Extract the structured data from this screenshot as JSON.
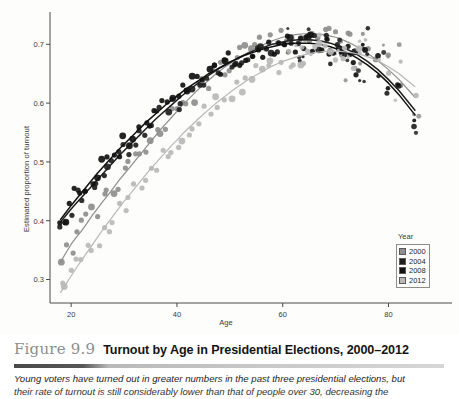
{
  "figure": {
    "number": "Figure 9.9",
    "title": "Turnout by Age in Presidential Elections, 2000–2012",
    "caption_line_1": "Young voters have turned out in greater numbers in the past three presidential elections, but",
    "caption_line_2": "their rate of turnout is still considerably lower than that of people over 30, decreasing the"
  },
  "legend": {
    "title": "Year",
    "items": [
      {
        "label": "2000",
        "color": "#8e8e8e"
      },
      {
        "label": "2004",
        "color": "#1f1f1f"
      },
      {
        "label": "2008",
        "color": "#111111"
      },
      {
        "label": "2012",
        "color": "#b8b8b8"
      }
    ]
  },
  "chart_data": {
    "type": "scatter",
    "title": "Turnout by Age in Presidential Elections, 2000–2012",
    "xlabel": "Age",
    "ylabel": "Estimated proportion of turnout",
    "xlim": [
      16,
      92
    ],
    "ylim": [
      0.26,
      0.755
    ],
    "xticks": [
      20,
      40,
      60,
      80
    ],
    "yticks": [
      0.3,
      0.4,
      0.5,
      0.6,
      0.7
    ],
    "ytick_labels": [
      "0.3",
      "0.4",
      "0.5",
      "0.6",
      "0.7"
    ],
    "xtick_labels": [
      "20",
      "40",
      "60",
      "80"
    ],
    "grid": false,
    "legend_position": "bottom-right",
    "legend_title": "Year",
    "series": [
      {
        "name": "2000",
        "color": "#8e8e8e",
        "x": [
          18,
          19,
          20,
          21,
          22,
          23,
          24,
          25,
          26,
          27,
          28,
          29,
          30,
          31,
          32,
          33,
          34,
          35,
          36,
          37,
          38,
          39,
          40,
          41,
          42,
          43,
          44,
          45,
          46,
          47,
          48,
          49,
          50,
          51,
          52,
          53,
          54,
          55,
          56,
          57,
          58,
          59,
          60,
          61,
          62,
          63,
          64,
          65,
          66,
          67,
          68,
          69,
          70,
          71,
          72,
          73,
          74,
          75,
          76,
          78,
          80,
          82,
          85
        ],
        "y": [
          0.33,
          0.345,
          0.36,
          0.372,
          0.383,
          0.396,
          0.409,
          0.421,
          0.433,
          0.444,
          0.456,
          0.468,
          0.479,
          0.49,
          0.501,
          0.512,
          0.523,
          0.534,
          0.545,
          0.556,
          0.566,
          0.576,
          0.586,
          0.596,
          0.605,
          0.614,
          0.623,
          0.631,
          0.639,
          0.647,
          0.654,
          0.661,
          0.667,
          0.673,
          0.679,
          0.684,
          0.689,
          0.694,
          0.698,
          0.702,
          0.706,
          0.709,
          0.712,
          0.714,
          0.716,
          0.717,
          0.718,
          0.718,
          0.718,
          0.717,
          0.716,
          0.714,
          0.712,
          0.709,
          0.705,
          0.701,
          0.696,
          0.691,
          0.685,
          0.672,
          0.657,
          0.64,
          0.61
        ],
        "fit_curve": true
      },
      {
        "name": "2004",
        "color": "#1f1f1f",
        "x": [
          18,
          19,
          20,
          21,
          22,
          23,
          24,
          25,
          26,
          27,
          28,
          29,
          30,
          31,
          32,
          33,
          34,
          35,
          36,
          37,
          38,
          39,
          40,
          41,
          42,
          43,
          44,
          45,
          46,
          47,
          48,
          49,
          50,
          51,
          52,
          53,
          54,
          55,
          56,
          57,
          58,
          59,
          60,
          61,
          62,
          63,
          64,
          65,
          66,
          67,
          68,
          69,
          70,
          71,
          72,
          73,
          74,
          75,
          76,
          78,
          80,
          82,
          85
        ],
        "y": [
          0.398,
          0.409,
          0.42,
          0.43,
          0.44,
          0.45,
          0.46,
          0.47,
          0.48,
          0.49,
          0.5,
          0.51,
          0.519,
          0.528,
          0.537,
          0.546,
          0.555,
          0.564,
          0.573,
          0.581,
          0.589,
          0.597,
          0.605,
          0.613,
          0.62,
          0.627,
          0.634,
          0.641,
          0.647,
          0.653,
          0.659,
          0.664,
          0.669,
          0.674,
          0.679,
          0.683,
          0.687,
          0.691,
          0.694,
          0.697,
          0.7,
          0.702,
          0.704,
          0.706,
          0.707,
          0.708,
          0.708,
          0.708,
          0.707,
          0.706,
          0.704,
          0.702,
          0.699,
          0.696,
          0.692,
          0.688,
          0.683,
          0.677,
          0.671,
          0.657,
          0.64,
          0.621,
          0.588
        ],
        "fit_curve": true
      },
      {
        "name": "2008",
        "color": "#111111",
        "x": [
          18,
          19,
          20,
          21,
          22,
          23,
          24,
          25,
          26,
          27,
          28,
          29,
          30,
          31,
          32,
          33,
          34,
          35,
          36,
          37,
          38,
          39,
          40,
          41,
          42,
          43,
          44,
          45,
          46,
          47,
          48,
          49,
          50,
          51,
          52,
          53,
          54,
          55,
          56,
          57,
          58,
          59,
          60,
          61,
          62,
          63,
          64,
          65,
          66,
          67,
          68,
          69,
          70,
          71,
          72,
          73,
          74,
          75,
          76,
          78,
          80,
          82,
          85
        ],
        "y": [
          0.402,
          0.414,
          0.426,
          0.437,
          0.448,
          0.459,
          0.47,
          0.481,
          0.491,
          0.501,
          0.511,
          0.521,
          0.53,
          0.539,
          0.548,
          0.557,
          0.566,
          0.574,
          0.582,
          0.59,
          0.598,
          0.605,
          0.612,
          0.619,
          0.626,
          0.632,
          0.638,
          0.644,
          0.65,
          0.655,
          0.66,
          0.665,
          0.67,
          0.674,
          0.678,
          0.682,
          0.685,
          0.688,
          0.691,
          0.694,
          0.696,
          0.698,
          0.7,
          0.701,
          0.702,
          0.702,
          0.702,
          0.702,
          0.701,
          0.7,
          0.698,
          0.696,
          0.693,
          0.69,
          0.686,
          0.682,
          0.677,
          0.671,
          0.665,
          0.651,
          0.634,
          0.614,
          0.58
        ],
        "fit_curve": true
      },
      {
        "name": "2012",
        "color": "#b8b8b8",
        "x": [
          18,
          19,
          20,
          21,
          22,
          23,
          24,
          25,
          26,
          27,
          28,
          29,
          30,
          31,
          32,
          33,
          34,
          35,
          36,
          37,
          38,
          39,
          40,
          41,
          42,
          43,
          44,
          45,
          46,
          47,
          48,
          49,
          50,
          51,
          52,
          53,
          54,
          55,
          56,
          57,
          58,
          59,
          60,
          61,
          62,
          63,
          64,
          65,
          66,
          67,
          68,
          69,
          70,
          71,
          72,
          73,
          74,
          75,
          76,
          78,
          80,
          82,
          85
        ],
        "y": [
          0.278,
          0.292,
          0.306,
          0.32,
          0.333,
          0.346,
          0.359,
          0.372,
          0.385,
          0.397,
          0.409,
          0.421,
          0.433,
          0.444,
          0.455,
          0.466,
          0.477,
          0.488,
          0.498,
          0.508,
          0.518,
          0.528,
          0.537,
          0.547,
          0.556,
          0.564,
          0.573,
          0.581,
          0.589,
          0.597,
          0.604,
          0.611,
          0.618,
          0.625,
          0.631,
          0.637,
          0.643,
          0.648,
          0.653,
          0.658,
          0.663,
          0.667,
          0.671,
          0.674,
          0.677,
          0.68,
          0.682,
          0.684,
          0.686,
          0.687,
          0.688,
          0.688,
          0.688,
          0.688,
          0.687,
          0.686,
          0.684,
          0.682,
          0.679,
          0.672,
          0.662,
          0.65,
          0.628
        ],
        "fit_curve": true
      }
    ]
  }
}
